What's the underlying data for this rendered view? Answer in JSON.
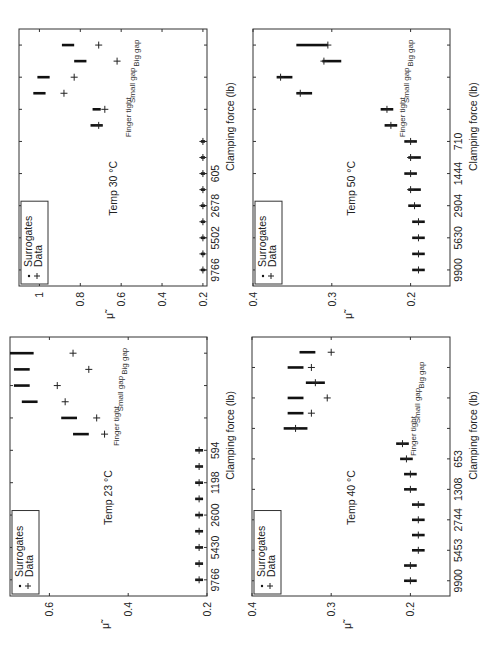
{
  "figure": {
    "orientation": "rotated-90-ccw",
    "x_axis_label": "Clamping force (lb)",
    "y_axis_label": "μ̃",
    "legend": {
      "surrogates": "Surrogates",
      "data": "Data"
    },
    "annotations": {
      "finger_tight": "Finger tight",
      "small_gap": "Small gap",
      "big_gap": "Big gap"
    }
  },
  "chart_data": [
    {
      "type": "scatter",
      "title": "Temp 30 °C",
      "position": "top-left",
      "xlabel": "Clamping force (lb)",
      "ylabel": "μ̃",
      "xtick_labels": [
        "9766",
        "5502",
        "2678",
        "605"
      ],
      "yticks": [
        0.2,
        0.4,
        0.6,
        0.8,
        1
      ],
      "ylim": [
        0.15,
        1.1
      ],
      "conditions": [
        "9766",
        "",
        "5502",
        "",
        "2678",
        "",
        "605",
        "",
        "",
        "finger tight",
        "finger tight",
        "small gap",
        "small gap",
        "big gap",
        "big gap"
      ],
      "series": [
        {
          "name": "Surrogates",
          "values": [
            0.2,
            0.2,
            0.2,
            0.2,
            0.2,
            0.2,
            0.2,
            0.2,
            0.2,
            0.72,
            0.72,
            1.0,
            0.98,
            0.8,
            0.86
          ],
          "spread": [
            0.01,
            0.01,
            0.01,
            0.01,
            0.01,
            0.01,
            0.01,
            0.01,
            0.01,
            0.03,
            0.02,
            0.03,
            0.03,
            0.03,
            0.03
          ]
        },
        {
          "name": "Data",
          "values": [
            0.2,
            0.2,
            0.2,
            0.2,
            0.2,
            0.2,
            0.2,
            0.2,
            0.2,
            0.71,
            0.68,
            0.88,
            0.83,
            0.62,
            0.71
          ]
        }
      ],
      "annotations": [
        {
          "text": "Finger tight",
          "at": "positions 10-11"
        },
        {
          "text": "Small gap",
          "at": "positions 12-13"
        },
        {
          "text": "Big gap",
          "at": "positions 14-15"
        }
      ],
      "legend_position": "upper-left",
      "grid": false
    },
    {
      "type": "scatter",
      "title": "Temp 50 °C",
      "position": "top-right",
      "xlabel": "Clamping force (lb)",
      "ylabel": "μ̃",
      "xtick_labels": [
        "9900",
        "5630",
        "2904",
        "1444",
        "710"
      ],
      "yticks": [
        0.2,
        0.3,
        0.4
      ],
      "ylim": [
        0.15,
        0.4
      ],
      "series": [
        {
          "name": "Surrogates",
          "values": [
            0.19,
            0.19,
            0.19,
            0.19,
            0.195,
            0.195,
            0.2,
            0.195,
            0.2,
            0.225,
            0.23,
            0.335,
            0.36,
            0.3,
            0.325
          ],
          "spread": [
            0.008,
            0.008,
            0.008,
            0.008,
            0.008,
            0.008,
            0.008,
            0.008,
            0.008,
            0.008,
            0.008,
            0.01,
            0.01,
            0.012,
            0.02
          ]
        },
        {
          "name": "Data",
          "values": [
            0.19,
            0.19,
            0.19,
            0.19,
            0.195,
            0.2,
            0.2,
            0.2,
            0.2,
            0.225,
            0.23,
            0.34,
            0.365,
            0.31,
            0.305
          ]
        }
      ],
      "annotations": [
        {
          "text": "Finger tight",
          "at": "positions 10-11"
        },
        {
          "text": "Small gap",
          "at": "positions 12-13"
        },
        {
          "text": "Big gap",
          "at": "positions 14-15"
        }
      ],
      "legend_position": "upper-left",
      "grid": false
    },
    {
      "type": "scatter",
      "title": "Temp 23 °C",
      "position": "bottom-left",
      "xlabel": "Clamping force (lb)",
      "ylabel": "μ̃",
      "xtick_labels": [
        "9766",
        "5430",
        "2600",
        "1198",
        "594"
      ],
      "yticks": [
        0.2,
        0.4,
        0.6
      ],
      "ylim": [
        0.2,
        0.7
      ],
      "series": [
        {
          "name": "Surrogates",
          "values": [
            0.22,
            0.22,
            0.22,
            0.22,
            0.22,
            0.22,
            0.22,
            0.22,
            0.22,
            0.52,
            0.55,
            0.65,
            0.67,
            0.67,
            0.67
          ],
          "spread": [
            0.01,
            0.01,
            0.01,
            0.01,
            0.01,
            0.01,
            0.01,
            0.01,
            0.01,
            0.02,
            0.02,
            0.02,
            0.02,
            0.02,
            0.03
          ]
        },
        {
          "name": "Data",
          "values": [
            0.22,
            0.22,
            0.22,
            0.22,
            0.22,
            0.22,
            0.22,
            0.22,
            0.22,
            0.46,
            0.48,
            0.56,
            0.58,
            0.5,
            0.54
          ]
        }
      ],
      "annotations": [
        {
          "text": "Finger tight",
          "at": "positions 10-11"
        },
        {
          "text": "Small gap",
          "at": "positions 12-13"
        },
        {
          "text": "Big gap",
          "at": "positions 14-15"
        }
      ],
      "legend_position": "upper-left",
      "grid": false
    },
    {
      "type": "scatter",
      "title": "Temp 40 °C",
      "position": "bottom-right",
      "xlabel": "Clamping force (lb)",
      "ylabel": "μ̃",
      "xtick_labels": [
        "9900",
        "5453",
        "2744",
        "1308",
        "653"
      ],
      "yticks": [
        0.2,
        0.3,
        0.4
      ],
      "ylim": [
        0.15,
        0.4
      ],
      "series": [
        {
          "name": "Surrogates",
          "values": [
            0.2,
            0.2,
            0.19,
            0.19,
            0.19,
            0.19,
            0.2,
            0.2,
            0.205,
            0.21,
            0.345,
            0.345,
            0.345,
            0.32,
            0.345,
            0.33
          ],
          "spread": [
            0.008,
            0.008,
            0.008,
            0.008,
            0.008,
            0.008,
            0.008,
            0.008,
            0.008,
            0.008,
            0.015,
            0.01,
            0.01,
            0.012,
            0.01,
            0.01
          ]
        },
        {
          "name": "Data",
          "values": [
            0.2,
            0.2,
            0.19,
            0.19,
            0.19,
            0.19,
            0.2,
            0.2,
            0.205,
            0.21,
            0.345,
            0.325,
            0.305,
            0.32,
            0.325,
            0.3
          ]
        }
      ],
      "annotations": [
        {
          "text": "Finger tight",
          "at": "positions 10-11"
        },
        {
          "text": "Small gap",
          "at": "positions 12-13"
        },
        {
          "text": "Big gap",
          "at": "positions 14-15"
        }
      ],
      "legend_position": "upper-left",
      "grid": false
    }
  ]
}
